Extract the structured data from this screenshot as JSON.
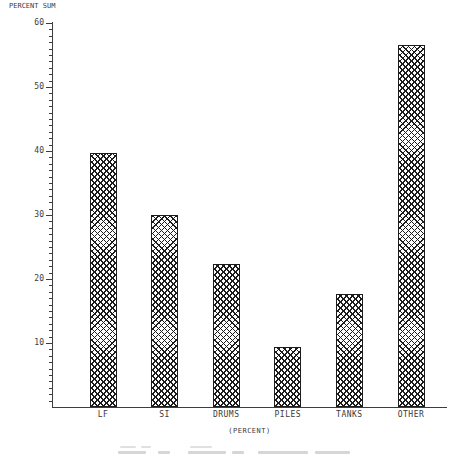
{
  "chart_data": {
    "type": "bar",
    "title": "PERCENT SUM",
    "xlabel": "(PERCENT)",
    "ylabel": "PERCENT SUM",
    "categories": [
      "LF",
      "SI",
      "DRUMS",
      "PILES",
      "TANKS",
      "OTHER"
    ],
    "values": [
      39.7,
      30.0,
      22.4,
      9.4,
      17.7,
      56.5
    ],
    "ylim": [
      0,
      60
    ],
    "yticks": [
      10,
      20,
      30,
      40,
      50,
      60
    ],
    "minor_tick_step": 1,
    "grid": false,
    "legend": "none",
    "bar_fill": "crosshatch",
    "colors": {
      "axis": "#3d3d3d",
      "text": "#3a3a3a",
      "bar_line": "#1c1c1c",
      "background": "#ffffff"
    }
  }
}
